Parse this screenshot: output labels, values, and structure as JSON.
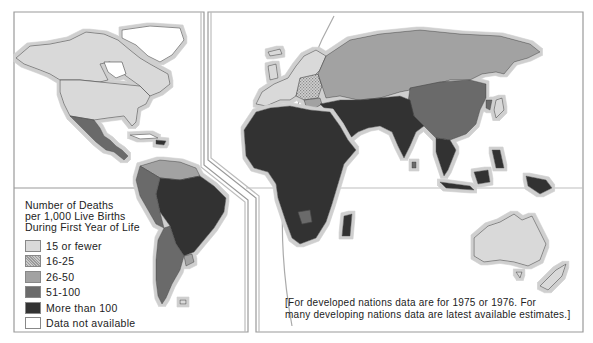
{
  "map": {
    "title": "Infant Mortality Rates",
    "panels": [
      "Americas",
      "Europe, Africa, Asia and Oceania"
    ]
  },
  "legend": {
    "title_lines": [
      "Number of Deaths",
      "per 1,000 Live Births",
      "During First Year of Life"
    ],
    "items": [
      {
        "label": "15 or fewer",
        "color": "#d9d9d9",
        "pattern": "solid"
      },
      {
        "label": "16-25",
        "color": "#bdbdbd",
        "pattern": "stipple"
      },
      {
        "label": "26-50",
        "color": "#a2a2a2",
        "pattern": "solid"
      },
      {
        "label": "51-100",
        "color": "#6b6b6b",
        "pattern": "solid"
      },
      {
        "label": "More than 100",
        "color": "#333333",
        "pattern": "solid"
      },
      {
        "label": "Data not available",
        "color": "#ffffff",
        "pattern": "solid"
      }
    ]
  },
  "note": {
    "lines": [
      "[For developed nations data are for 1975 or 1976. For",
      "many developing nations data are latest available estimates.]"
    ]
  },
  "regions": [
    {
      "name": "North America (USA, Canada)",
      "category": "15 or fewer"
    },
    {
      "name": "Greenland",
      "category": "Data not available"
    },
    {
      "name": "Mexico",
      "category": "51-100"
    },
    {
      "name": "Central America",
      "category": "51-100"
    },
    {
      "name": "Caribbean (Haiti)",
      "category": "More than 100"
    },
    {
      "name": "Venezuela / Guianas",
      "category": "26-50"
    },
    {
      "name": "Colombia / Peru / Ecuador",
      "category": "51-100"
    },
    {
      "name": "Brazil / Bolivia",
      "category": "More than 100"
    },
    {
      "name": "Argentina / Chile",
      "category": "51-100"
    },
    {
      "name": "Uruguay",
      "category": "26-50"
    },
    {
      "name": "Western Europe",
      "category": "15 or fewer"
    },
    {
      "name": "Eastern Europe",
      "category": "16-25"
    },
    {
      "name": "USSR",
      "category": "26-50"
    },
    {
      "name": "Africa",
      "category": "More than 100"
    },
    {
      "name": "Botswana",
      "category": "51-100"
    },
    {
      "name": "Middle East",
      "category": "More than 100"
    },
    {
      "name": "China / Mongolia",
      "category": "51-100"
    },
    {
      "name": "South Asia (India)",
      "category": "More than 100"
    },
    {
      "name": "Southeast Asia",
      "category": "More than 100"
    },
    {
      "name": "Japan",
      "category": "15 or fewer"
    },
    {
      "name": "Australia",
      "category": "15 or fewer"
    },
    {
      "name": "New Zealand",
      "category": "15 or fewer"
    }
  ],
  "colors": {
    "frame": "#9a9a9a",
    "coast_halo": "#c8c8c8",
    "border": "#555555"
  }
}
